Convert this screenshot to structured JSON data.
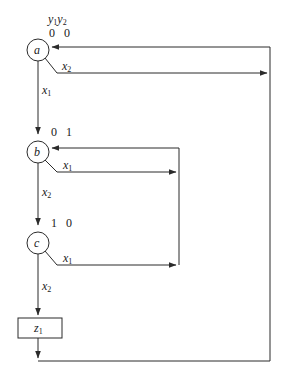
{
  "diagram": {
    "type": "state-flow-diagram",
    "title": "",
    "stroke_color": "#2b2b2b",
    "text_color": "#1a1a1a",
    "background": "#ffffff",
    "secondary_state_vars": {
      "label_y1": "y",
      "label_y1_sub": "1",
      "label_y2": "y",
      "label_y2_sub": "2"
    },
    "states": [
      {
        "id": "a",
        "name": "a",
        "encoding": "0 0",
        "cx": 38,
        "cy": 50,
        "r": 11
      },
      {
        "id": "b",
        "name": "b",
        "encoding": "0 1",
        "cx": 38,
        "cy": 152,
        "r": 11
      },
      {
        "id": "c",
        "name": "c",
        "encoding": "1 0",
        "cx": 38,
        "cy": 243,
        "r": 11
      }
    ],
    "outputs": [
      {
        "id": "z1",
        "symbol": "z",
        "subscript": "1",
        "x": 18,
        "y": 318,
        "w": 44,
        "h": 20
      }
    ],
    "transition_labels": [
      {
        "id": "a-x2",
        "symbol": "x",
        "subscript": "2",
        "from": "a",
        "branch": "right"
      },
      {
        "id": "a-x1",
        "symbol": "x",
        "subscript": "1",
        "from": "a",
        "branch": "down"
      },
      {
        "id": "b-x1",
        "symbol": "x",
        "subscript": "1",
        "from": "b",
        "branch": "right"
      },
      {
        "id": "b-x2",
        "symbol": "x",
        "subscript": "2",
        "from": "b",
        "branch": "down"
      },
      {
        "id": "c-x1",
        "symbol": "x",
        "subscript": "1",
        "from": "c",
        "branch": "right"
      },
      {
        "id": "c-x2",
        "symbol": "x",
        "subscript": "2",
        "from": "c",
        "branch": "down"
      }
    ],
    "edges": [
      {
        "id": "edge-a-to-b",
        "from": "a",
        "to": "b",
        "condition": "x1"
      },
      {
        "id": "edge-b-to-c",
        "from": "b",
        "to": "c",
        "condition": "x2"
      },
      {
        "id": "edge-c-to-z1",
        "from": "c",
        "to": "z1",
        "condition": "x2"
      },
      {
        "id": "edge-a-x2-to-right-bus",
        "from": "a",
        "to": "right-bus",
        "condition": "x2"
      },
      {
        "id": "edge-b-x1-to-inner-bus",
        "from": "b",
        "to": "inner-bus",
        "condition": "x1"
      },
      {
        "id": "edge-c-x1-to-inner-bus",
        "from": "c",
        "to": "inner-bus",
        "condition": "x1"
      },
      {
        "id": "edge-inner-bus-to-b",
        "from": "inner-bus",
        "to": "b",
        "condition": ""
      },
      {
        "id": "edge-z1-to-bottom-bus",
        "from": "z1",
        "to": "bottom-bus",
        "condition": ""
      },
      {
        "id": "edge-right-bus-to-a",
        "from": "right-bus",
        "to": "a",
        "condition": ""
      }
    ]
  }
}
